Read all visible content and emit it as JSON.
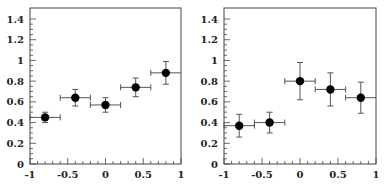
{
  "chart_data": [
    {
      "type": "scatter",
      "title": "",
      "xlabel": "",
      "ylabel": "",
      "xlim": [
        -1,
        1
      ],
      "ylim": [
        0,
        1.5
      ],
      "grid": false,
      "legend": null,
      "x_ticks": [
        "-1",
        "-0.5",
        "0",
        "0.5",
        "1"
      ],
      "y_ticks": [
        "0",
        "0.2",
        "0.4",
        "0.6",
        "0.8",
        "1",
        "1.2",
        "1.4"
      ],
      "series": [
        {
          "name": "data",
          "marker": "filled-circle",
          "x": [
            -0.8,
            -0.4,
            0.0,
            0.4,
            0.8
          ],
          "y": [
            0.45,
            0.64,
            0.57,
            0.74,
            0.88
          ],
          "x_err": [
            0.2,
            0.2,
            0.2,
            0.2,
            0.2
          ],
          "y_err": [
            0.05,
            0.08,
            0.07,
            0.09,
            0.11
          ]
        }
      ]
    },
    {
      "type": "scatter",
      "title": "",
      "xlabel": "",
      "ylabel": "",
      "xlim": [
        -1,
        1
      ],
      "ylim": [
        0,
        1.5
      ],
      "grid": false,
      "legend": null,
      "x_ticks": [
        "-1",
        "-0.5",
        "0",
        "0.5",
        "1"
      ],
      "y_ticks": [
        "0",
        "0.2",
        "0.4",
        "0.6",
        "0.8",
        "1",
        "1.2",
        "1.4"
      ],
      "series": [
        {
          "name": "data",
          "marker": "filled-circle",
          "x": [
            -0.8,
            -0.4,
            0.0,
            0.4,
            0.8
          ],
          "y": [
            0.37,
            0.4,
            0.8,
            0.72,
            0.64
          ],
          "x_err": [
            0.2,
            0.2,
            0.2,
            0.2,
            0.2
          ],
          "y_err": [
            0.11,
            0.1,
            0.18,
            0.16,
            0.15
          ]
        }
      ]
    }
  ],
  "colors": {
    "axis": "#444444",
    "marker": "#000000",
    "errorbar": "#555555"
  }
}
